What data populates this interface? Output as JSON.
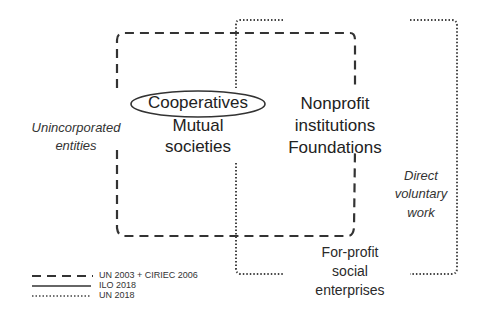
{
  "diagram": {
    "center_left": {
      "top": "Cooperatives",
      "mid": "Mutual",
      "bottom": "societies"
    },
    "center_right": {
      "top": "Nonprofit",
      "mid": "institutions",
      "bottom": "Foundations"
    },
    "left_outside": {
      "line1": "Unincorporated",
      "line2": "entities"
    },
    "right_outside": {
      "line1": "Direct",
      "line2": "voluntary",
      "line3": "work"
    },
    "bottom_outside": {
      "line1": "For-profit",
      "line2": "social",
      "line3": "enterprises"
    }
  },
  "legend": [
    {
      "style": "dashed",
      "label": "UN 2003 + CIRIEC 2006"
    },
    {
      "style": "solid",
      "label": "ILO 2018"
    },
    {
      "style": "dotted",
      "label": "UN 2018"
    }
  ],
  "colors": {
    "line": "#333333",
    "background": "#ffffff"
  }
}
